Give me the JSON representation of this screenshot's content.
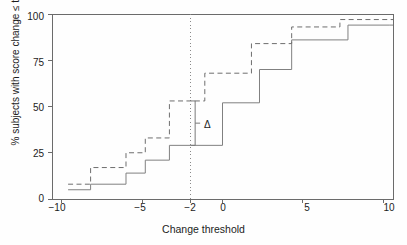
{
  "chart_data": {
    "type": "line",
    "title": "",
    "subtitle": "",
    "xlabel": "Change threshold",
    "ylabel": "% subjects with score change ≤ threshold",
    "xlim": [
      -10.6,
      10.6
    ],
    "ylim": [
      0,
      100
    ],
    "xticks": [
      -10,
      -5,
      -2,
      0,
      5,
      10
    ],
    "xticklabels": [
      "−10",
      "−5",
      "−2",
      "0",
      "5",
      "10"
    ],
    "yticks": [
      0,
      25,
      50,
      75,
      100
    ],
    "yticklabels": [
      "0",
      "25",
      "50",
      "75",
      "100"
    ],
    "grid": false,
    "legend": "none",
    "drawstyle": "steps-post",
    "series": [
      {
        "name": "solid-curve",
        "style": "solid",
        "color": "#808080",
        "x": [
          -9.6,
          -8.2,
          -6.0,
          -4.8,
          -3.3,
          0.0,
          2.3,
          4.3,
          7.8,
          10.4
        ],
        "y": [
          5,
          8,
          14,
          21,
          29,
          52,
          70,
          86,
          94,
          94
        ]
      },
      {
        "name": "dashed-curve",
        "style": "dashed",
        "color": "#6e6e6e",
        "x": [
          -9.6,
          -8.2,
          -6.0,
          -4.8,
          -3.3,
          -1.1,
          1.8,
          4.3,
          7.3,
          10.4
        ],
        "y": [
          8,
          17,
          25,
          33,
          53,
          68,
          84,
          93,
          97,
          97
        ]
      }
    ],
    "vline": {
      "name": "threshold-marker",
      "x": -2,
      "style": "dash-dot",
      "color": "#8a8a8a"
    },
    "annotations": [
      {
        "name": "delta-bracket",
        "label": "Δ",
        "x": -1.7,
        "y_low": 29,
        "y_high": 53,
        "value_low": 29,
        "value_high": 53
      }
    ]
  },
  "axis": {
    "x_tick_labels": [
      "−10",
      "−5",
      "−2",
      "0",
      "5",
      "10"
    ],
    "y_tick_labels": [
      "0",
      "25",
      "50",
      "75",
      "100"
    ],
    "x_title": "Change threshold",
    "y_title": "% subjects with score change ≤ threshold"
  },
  "annotation": {
    "delta_symbol": "Δ"
  },
  "colors": {
    "axis": "#666666",
    "solid_series": "#808080",
    "dashed_series": "#6e6e6e",
    "vline": "#8a8a8a",
    "text": "#1c1c1c",
    "background": "#fefefe"
  }
}
